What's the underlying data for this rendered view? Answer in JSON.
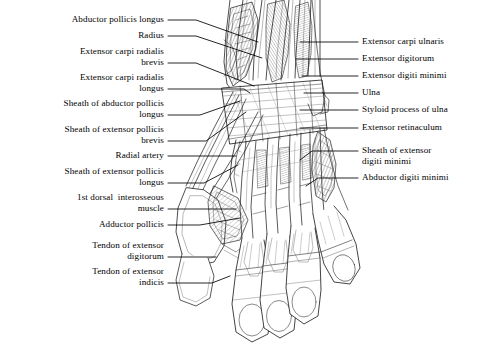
{
  "figure": {
    "background_color": "#ffffff",
    "ink_color": "#1a1a1a",
    "leader_color": "#000000"
  },
  "labels_left": [
    {
      "id": "abductor-pollicis-longus",
      "lines": [
        "Abductor pollicis longus"
      ],
      "x": 28,
      "y": 14,
      "width": 136,
      "leader": [
        [
          168,
          20
        ],
        [
          196,
          20
        ],
        [
          258,
          42
        ]
      ]
    },
    {
      "id": "radius",
      "lines": [
        "Radius"
      ],
      "x": 28,
      "y": 30,
      "width": 136,
      "leader": [
        [
          168,
          36
        ],
        [
          196,
          36
        ],
        [
          262,
          58
        ]
      ]
    },
    {
      "id": "extensor-carpi-radialis-brevis",
      "lines": [
        "Extensor carpi radialis",
        "brevis"
      ],
      "x": 28,
      "y": 46,
      "width": 136,
      "leader": [
        [
          168,
          63
        ],
        [
          196,
          63
        ],
        [
          254,
          86
        ]
      ]
    },
    {
      "id": "extensor-carpi-radialis-longus",
      "lines": [
        "Extensor carpi radialis",
        "longus"
      ],
      "x": 22,
      "y": 72,
      "width": 142,
      "leader": [
        [
          168,
          89
        ],
        [
          244,
          89
        ],
        [
          250,
          93
        ]
      ]
    },
    {
      "id": "sheath-of-abductor-pollicis-longus",
      "lines": [
        "Sheath of abductor pollicis",
        "longus"
      ],
      "x": 12,
      "y": 98,
      "width": 152,
      "leader": [
        [
          168,
          115
        ],
        [
          200,
          115
        ],
        [
          240,
          101
        ]
      ]
    },
    {
      "id": "sheath-of-extensor-pollicis-brevis",
      "lines": [
        "Sheath of extensor pollicis",
        "brevis"
      ],
      "x": 12,
      "y": 124,
      "width": 152,
      "leader": [
        [
          168,
          141
        ],
        [
          206,
          141
        ],
        [
          246,
          112
        ]
      ]
    },
    {
      "id": "radial-artery",
      "lines": [
        "Radial artery"
      ],
      "x": 28,
      "y": 150,
      "width": 136,
      "leader": [
        [
          168,
          156
        ],
        [
          236,
          156
        ]
      ]
    },
    {
      "id": "sheath-of-extensor-pollicis-longus",
      "lines": [
        "Sheath of extensor pollicis",
        "longus"
      ],
      "x": 12,
      "y": 166,
      "width": 152,
      "leader": [
        [
          168,
          183
        ],
        [
          204,
          183
        ],
        [
          238,
          165
        ]
      ]
    },
    {
      "id": "first-dorsal-interosseous-muscle",
      "lines": [
        "1st dorsal  interosseous",
        "muscle"
      ],
      "x": 22,
      "y": 192,
      "width": 142,
      "leader": [
        [
          168,
          209
        ],
        [
          236,
          209
        ]
      ]
    },
    {
      "id": "adductor-pollicis",
      "lines": [
        "Adductor pollicis"
      ],
      "x": 28,
      "y": 219,
      "width": 136,
      "leader": [
        [
          168,
          225
        ],
        [
          200,
          225
        ],
        [
          240,
          218
        ]
      ]
    },
    {
      "id": "tendon-of-extensor-digitorum",
      "lines": [
        "Tendon of extensor",
        "digitorum"
      ],
      "x": 28,
      "y": 240,
      "width": 136,
      "leader": [
        [
          168,
          257
        ],
        [
          216,
          257
        ]
      ]
    },
    {
      "id": "tendon-of-extensor-indicis",
      "lines": [
        "Tendon of extensor",
        "indicis"
      ],
      "x": 28,
      "y": 266,
      "width": 136,
      "leader": [
        [
          168,
          283
        ],
        [
          212,
          283
        ],
        [
          230,
          276
        ]
      ]
    }
  ],
  "labels_right": [
    {
      "id": "extensor-carpi-ulnaris",
      "lines": [
        "Extensor carpi ulnaris"
      ],
      "x": 362,
      "y": 36,
      "width": 124,
      "leader": [
        [
          358,
          42
        ],
        [
          300,
          42
        ]
      ]
    },
    {
      "id": "extensor-digitorum",
      "lines": [
        "Extensor digitorum"
      ],
      "x": 362,
      "y": 53,
      "width": 124,
      "leader": [
        [
          358,
          59
        ],
        [
          296,
          59
        ]
      ]
    },
    {
      "id": "extensor-digiti-minimi",
      "lines": [
        "Extensor digiti minimi"
      ],
      "x": 362,
      "y": 70,
      "width": 124,
      "leader": [
        [
          358,
          76
        ],
        [
          302,
          76
        ]
      ]
    },
    {
      "id": "ulna",
      "lines": [
        "Ulna"
      ],
      "x": 362,
      "y": 87,
      "width": 124,
      "leader": [
        [
          358,
          93
        ],
        [
          304,
          93
        ]
      ]
    },
    {
      "id": "styloid-process-of-ulna",
      "lines": [
        "Styloid process of ulna"
      ],
      "x": 362,
      "y": 104,
      "width": 124,
      "leader": [
        [
          358,
          110
        ],
        [
          300,
          110
        ]
      ]
    },
    {
      "id": "extensor-retinaculum",
      "lines": [
        "Extensor retinaculum"
      ],
      "x": 362,
      "y": 122,
      "width": 124,
      "leader": [
        [
          358,
          128
        ],
        [
          300,
          128
        ]
      ]
    },
    {
      "id": "sheath-of-extensor-digiti-minimi",
      "lines": [
        "Sheath of extensor",
        "digiti minimi"
      ],
      "x": 362,
      "y": 145,
      "width": 124,
      "leader": [
        [
          358,
          151
        ],
        [
          312,
          151
        ],
        [
          300,
          160
        ]
      ]
    },
    {
      "id": "abductor-digiti-minimi",
      "lines": [
        "Abductor digiti minimi"
      ],
      "x": 362,
      "y": 172,
      "width": 124,
      "leader": [
        [
          358,
          178
        ],
        [
          318,
          178
        ],
        [
          306,
          186
        ]
      ]
    }
  ]
}
